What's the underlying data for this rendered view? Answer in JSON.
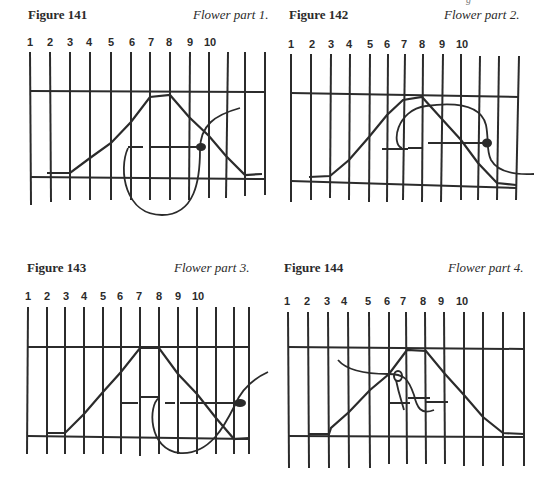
{
  "page": {
    "top_crop_text": "g"
  },
  "figures": [
    {
      "id": "fig141",
      "title": "Figure 141",
      "caption": "Flower part 1.",
      "numbers": [
        "1",
        "2",
        "3",
        "4",
        "5",
        "6",
        "7",
        "8",
        "9",
        "10"
      ]
    },
    {
      "id": "fig142",
      "title": "Figure 142",
      "caption": "Flower part 2.",
      "numbers": [
        "1",
        "2",
        "3",
        "4",
        "5",
        "6",
        "7",
        "8",
        "9",
        "10"
      ]
    },
    {
      "id": "fig143",
      "title": "Figure 143",
      "caption": "Flower part 3.",
      "numbers": [
        "1",
        "2",
        "3",
        "4",
        "5",
        "6",
        "7",
        "8",
        "9",
        "10"
      ]
    },
    {
      "id": "fig144",
      "title": "Figure 144",
      "caption": "Flower part 4.",
      "numbers": [
        "1",
        "2",
        "3",
        "4",
        "5",
        "6",
        "7",
        "8",
        "9",
        "10"
      ]
    }
  ],
  "colors": {
    "ink": "#2b2b2b",
    "paper": "#ffffff"
  }
}
